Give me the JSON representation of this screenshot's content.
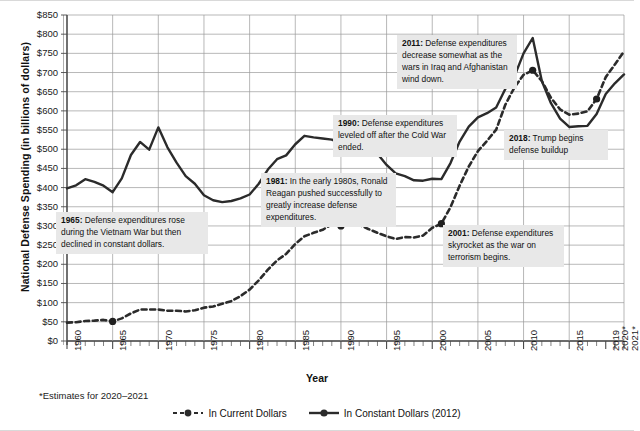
{
  "chart_data": {
    "type": "line",
    "title": "",
    "xlabel": "Year",
    "ylabel": "National Defense Spending (in billions of dollars)",
    "ylim": [
      0,
      850
    ],
    "ytick_step": 50,
    "grid": true,
    "xlim": [
      1960,
      2021
    ],
    "xtick_labels": [
      "1960",
      "1965",
      "1970",
      "1975",
      "1980",
      "1985",
      "1990",
      "1995",
      "2000",
      "2005",
      "2010",
      "2015",
      "2019",
      "2020*",
      "2021*"
    ],
    "xtick_years": [
      1960,
      1965,
      1970,
      1975,
      1980,
      1985,
      1990,
      1995,
      2000,
      2005,
      2010,
      2015,
      2019,
      2020,
      2021
    ],
    "ytick_labels": [
      "$0",
      "$50",
      "$100",
      "$150",
      "$200",
      "$250",
      "$300",
      "$350",
      "$400",
      "$450",
      "$500",
      "$550",
      "$600",
      "$650",
      "$700",
      "$750",
      "$800",
      "$850"
    ],
    "legend_position": "bottom",
    "footnote": "*Estimates for 2020–2021",
    "x": [
      1960,
      1961,
      1962,
      1963,
      1964,
      1965,
      1966,
      1967,
      1968,
      1969,
      1970,
      1971,
      1972,
      1973,
      1974,
      1975,
      1976,
      1977,
      1978,
      1979,
      1980,
      1981,
      1982,
      1983,
      1984,
      1985,
      1986,
      1987,
      1988,
      1989,
      1990,
      1991,
      1992,
      1993,
      1994,
      1995,
      1996,
      1997,
      1998,
      1999,
      2000,
      2001,
      2002,
      2003,
      2004,
      2005,
      2006,
      2007,
      2008,
      2009,
      2010,
      2011,
      2012,
      2013,
      2014,
      2015,
      2016,
      2017,
      2018,
      2019,
      2020,
      2021
    ],
    "series": [
      {
        "name": "In Current Dollars",
        "style": "dashed",
        "color": "#2b2b2b",
        "values": [
          48,
          49,
          52,
          53,
          55,
          51,
          59,
          72,
          82,
          82,
          82,
          79,
          79,
          77,
          80,
          87,
          90,
          97,
          104,
          117,
          134,
          158,
          186,
          210,
          227,
          253,
          273,
          282,
          290,
          304,
          300,
          320,
          303,
          292,
          282,
          273,
          266,
          271,
          270,
          275,
          295,
          306,
          349,
          405,
          455,
          495,
          522,
          551,
          616,
          661,
          694,
          706,
          678,
          634,
          604,
          590,
          593,
          599,
          631,
          688,
          721,
          755
        ]
      },
      {
        "name": "In Constant Dollars (2012)",
        "style": "solid",
        "color": "#2b2b2b",
        "values": [
          398,
          406,
          422,
          415,
          405,
          388,
          424,
          485,
          519,
          499,
          557,
          505,
          465,
          430,
          410,
          380,
          367,
          362,
          365,
          372,
          382,
          410,
          447,
          474,
          484,
          513,
          535,
          531,
          528,
          525,
          515,
          559,
          498,
          511,
          488,
          459,
          437,
          430,
          419,
          418,
          423,
          422,
          464,
          520,
          559,
          583,
          594,
          609,
          657,
          690,
          750,
          790,
          678,
          620,
          580,
          558,
          560,
          561,
          592,
          644,
          672,
          695
        ]
      }
    ],
    "markers": [
      {
        "year": 1965,
        "series": "In Current Dollars",
        "value": 51
      },
      {
        "year": 1990,
        "series": "In Current Dollars",
        "value": 300
      },
      {
        "year": 2001,
        "series": "In Current Dollars",
        "value": 306
      },
      {
        "year": 2011,
        "series": "In Current Dollars",
        "value": 706
      },
      {
        "year": 2018,
        "series": "In Current Dollars",
        "value": 631
      }
    ],
    "annotations": [
      {
        "year": 1965,
        "label": "1965",
        "text": "Defense expenditures rose during the Vietnam War but then declined in constant dollars.",
        "box": {
          "left": 56,
          "top": 211,
          "width": 152
        }
      },
      {
        "year": 1981,
        "label": "1981",
        "text": "In the early 1980s, Ronald Reagan pushed successfully to greatly increase defense expenditures.",
        "box": {
          "left": 261,
          "top": 172,
          "width": 135
        }
      },
      {
        "year": 1990,
        "label": "1990",
        "text": "Defense expenditures leveled off after the Cold War ended.",
        "box": {
          "left": 333,
          "top": 114,
          "width": 124
        }
      },
      {
        "year": 2011,
        "label": "2011",
        "text": "Defense expenditures decrease somewhat as the wars in Iraq and Afghanistan wind down.",
        "box": {
          "left": 397,
          "top": 34,
          "width": 120
        }
      },
      {
        "year": 2018,
        "label": "2018",
        "text": "Trump begins defense buildup",
        "box": {
          "left": 504,
          "top": 129,
          "width": 104
        }
      },
      {
        "year": 2001,
        "label": "2001",
        "text": "Defense expenditures skyrocket as the war on terrorism begins.",
        "box": {
          "left": 443,
          "top": 224,
          "width": 121
        }
      }
    ]
  }
}
